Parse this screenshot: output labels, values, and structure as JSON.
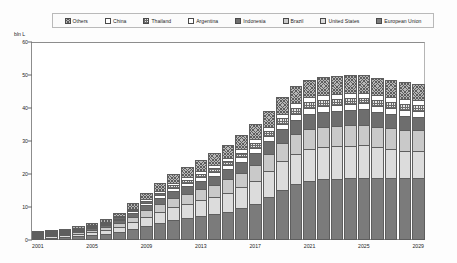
{
  "axes": {
    "unit_label": "bln L",
    "y_ticks": [
      0,
      10,
      20,
      30,
      40,
      50,
      60
    ],
    "y_min": 0,
    "y_max": 60,
    "x_tick_labels": [
      "2001",
      "2005",
      "2009",
      "2013",
      "2017",
      "2021",
      "2025",
      "2029"
    ]
  },
  "legend": {
    "items": [
      {
        "label": "Others",
        "pattern": "crosshatch-dark",
        "color": "#8a8a8a"
      },
      {
        "label": "China",
        "pattern": "open-white",
        "color": "#ffffff"
      },
      {
        "label": "Thailand",
        "pattern": "checker-mid",
        "color": "#9e9e9e"
      },
      {
        "label": "Argentina",
        "pattern": "open-white",
        "color": "#fbfbfb"
      },
      {
        "label": "Indonesia",
        "pattern": "solid-dark",
        "color": "#6e6e6e"
      },
      {
        "label": "Brazil",
        "pattern": "solid-light",
        "color": "#c9c9c9"
      },
      {
        "label": "United States",
        "pattern": "solid-pale",
        "color": "#d9d9d9"
      },
      {
        "label": "European Union",
        "pattern": "solid-darkest",
        "color": "#7a7a7a"
      }
    ]
  },
  "chart_data": {
    "type": "bar",
    "title": "",
    "subtitle": "",
    "xlabel": "",
    "ylabel": "bln L",
    "ylim": [
      0,
      60
    ],
    "grid": false,
    "stacked": true,
    "legend_position": "top",
    "categories": [
      "2001",
      "2002",
      "2003",
      "2004",
      "2005",
      "2006",
      "2007",
      "2008",
      "2009",
      "2010",
      "2011",
      "2012",
      "2013",
      "2014",
      "2015",
      "2016",
      "2017",
      "2018",
      "2019",
      "2020",
      "2021",
      "2022",
      "2023",
      "2024",
      "2025",
      "2026",
      "2027",
      "2028",
      "2029"
    ],
    "series": [
      {
        "name": "European Union",
        "color": "#7a7a7a",
        "values": [
          0.5,
          0.7,
          0.9,
          1.1,
          1.4,
          1.8,
          2.4,
          3.2,
          4.2,
          5.2,
          6.0,
          6.6,
          7.2,
          7.8,
          8.6,
          9.6,
          11.0,
          13.0,
          15.2,
          17.0,
          18.0,
          18.4,
          18.6,
          18.8,
          18.9,
          18.9,
          18.9,
          18.9,
          18.9
        ]
      },
      {
        "name": "United States",
        "color": "#d9d9d9",
        "values": [
          0.3,
          0.4,
          0.5,
          0.7,
          0.9,
          1.2,
          1.6,
          2.2,
          2.8,
          3.4,
          4.0,
          4.4,
          4.8,
          5.2,
          5.8,
          6.4,
          7.0,
          7.8,
          8.6,
          9.2,
          9.6,
          9.7,
          9.8,
          9.8,
          9.8,
          9.2,
          8.6,
          8.2,
          8.0
        ]
      },
      {
        "name": "Brazil",
        "color": "#c9c9c9",
        "values": [
          0.2,
          0.3,
          0.4,
          0.5,
          0.7,
          0.9,
          1.2,
          1.6,
          2.0,
          2.4,
          2.8,
          3.1,
          3.4,
          3.7,
          4.0,
          4.4,
          4.8,
          5.2,
          5.6,
          5.9,
          6.1,
          6.2,
          6.2,
          6.3,
          6.3,
          6.3,
          6.3,
          6.3,
          6.3
        ]
      },
      {
        "name": "Indonesia",
        "color": "#6e6e6e",
        "values": [
          0.1,
          0.2,
          0.3,
          0.4,
          0.5,
          0.7,
          0.9,
          1.2,
          1.5,
          1.8,
          2.1,
          2.3,
          2.5,
          2.8,
          3.0,
          3.3,
          3.6,
          3.9,
          4.2,
          4.4,
          4.5,
          4.6,
          4.6,
          4.6,
          4.6,
          4.5,
          4.4,
          4.3,
          4.2
        ]
      },
      {
        "name": "Argentina",
        "color": "#fbfbfb",
        "values": [
          0.05,
          0.08,
          0.1,
          0.15,
          0.2,
          0.3,
          0.4,
          0.5,
          0.7,
          0.8,
          0.9,
          1.0,
          1.1,
          1.2,
          1.3,
          1.4,
          1.5,
          1.6,
          1.7,
          1.8,
          1.8,
          1.8,
          1.8,
          1.8,
          1.8,
          1.8,
          1.8,
          1.8,
          1.8
        ]
      },
      {
        "name": "Thailand",
        "color": "#9e9e9e",
        "values": [
          0.05,
          0.07,
          0.1,
          0.12,
          0.18,
          0.25,
          0.35,
          0.45,
          0.6,
          0.7,
          0.8,
          0.9,
          1.0,
          1.1,
          1.2,
          1.3,
          1.4,
          1.5,
          1.6,
          1.6,
          1.7,
          1.7,
          1.7,
          1.7,
          1.7,
          1.7,
          1.7,
          1.7,
          1.7
        ]
      },
      {
        "name": "China",
        "color": "#ffffff",
        "values": [
          0.05,
          0.07,
          0.09,
          0.12,
          0.16,
          0.22,
          0.3,
          0.4,
          0.5,
          0.6,
          0.7,
          0.8,
          0.85,
          0.9,
          1.0,
          1.1,
          1.2,
          1.3,
          1.4,
          1.5,
          1.5,
          1.5,
          1.5,
          1.5,
          1.5,
          1.5,
          1.5,
          1.5,
          1.5
        ]
      },
      {
        "name": "Others",
        "color": "#8a8a8a",
        "values": [
          0.2,
          0.3,
          0.4,
          0.5,
          0.7,
          0.9,
          1.2,
          1.6,
          2.0,
          2.4,
          2.8,
          3.1,
          3.4,
          3.7,
          4.0,
          4.3,
          4.6,
          4.9,
          5.1,
          5.3,
          5.4,
          5.4,
          5.4,
          5.4,
          5.4,
          5.3,
          5.2,
          5.1,
          5.0
        ]
      }
    ],
    "totals": [
      1.45,
      2.12,
      2.79,
      3.59,
      4.74,
      6.27,
      8.35,
      11.15,
      14.3,
      17.3,
      20.1,
      22.2,
      24.3,
      26.4,
      28.9,
      31.8,
      35.1,
      39.2,
      43.4,
      46.7,
      48.6,
      49.3,
      49.6,
      49.9,
      50.0,
      48.4,
      46.8,
      45.8,
      45.4
    ]
  }
}
